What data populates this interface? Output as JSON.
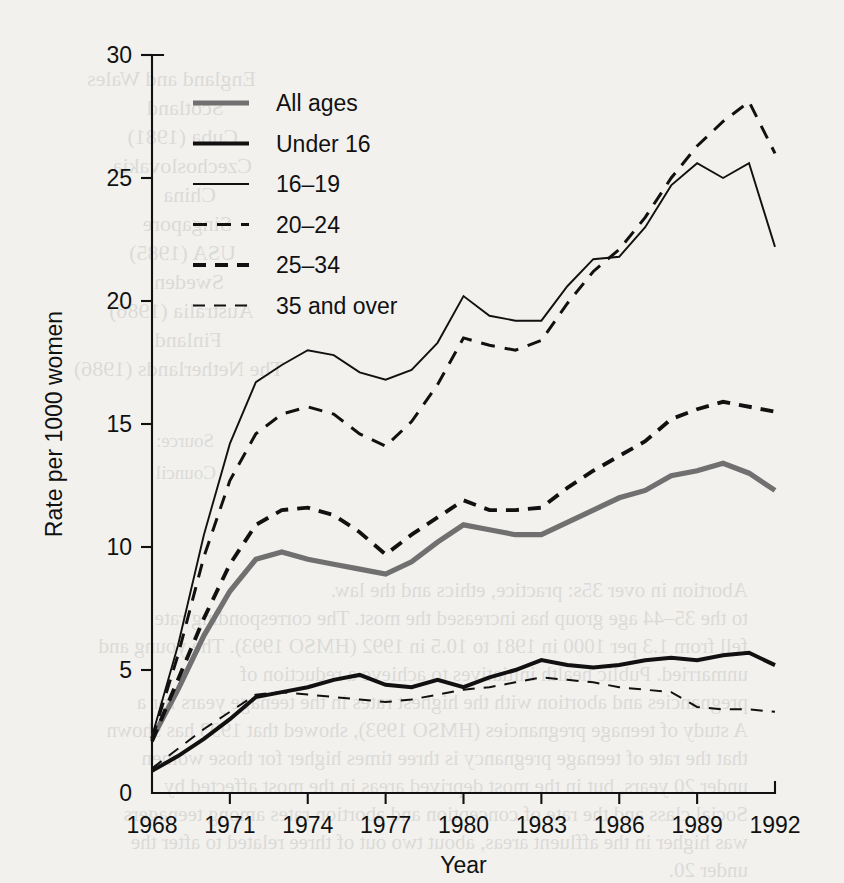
{
  "chart_data": {
    "type": "line",
    "title": "",
    "xlabel": "Year",
    "ylabel": "Rate per 1000 women",
    "xlim": [
      1968,
      1992
    ],
    "ylim": [
      0,
      30
    ],
    "grid": false,
    "legend_position": "top-left",
    "x_ticks": [
      "1968",
      "1971",
      "1974",
      "1977",
      "1980",
      "1983",
      "1986",
      "1989",
      "1992"
    ],
    "x_tick_values": [
      1968,
      1971,
      1974,
      1977,
      1980,
      1983,
      1986,
      1989,
      1992
    ],
    "y_ticks": [
      "0",
      "5",
      "10",
      "15",
      "20",
      "25",
      "30"
    ],
    "y_tick_values": [
      0,
      5,
      10,
      15,
      20,
      25,
      30
    ],
    "x": [
      1968,
      1969,
      1970,
      1971,
      1972,
      1973,
      1974,
      1975,
      1976,
      1977,
      1978,
      1979,
      1980,
      1981,
      1982,
      1983,
      1984,
      1985,
      1986,
      1987,
      1988,
      1989,
      1990,
      1991,
      1992
    ],
    "series": [
      {
        "name": "All ages",
        "style": "thick-grey-solid",
        "color": "#707070",
        "width": 5.2,
        "dash": "none",
        "values": [
          2.2,
          4.2,
          6.4,
          8.2,
          9.5,
          9.8,
          9.5,
          9.3,
          9.1,
          8.9,
          9.4,
          10.2,
          10.9,
          10.7,
          10.5,
          10.5,
          11.0,
          11.5,
          12.0,
          12.3,
          12.9,
          13.1,
          13.4,
          13.0,
          12.3
        ]
      },
      {
        "name": "Under 16",
        "style": "thick-black-solid",
        "color": "#111111",
        "width": 4.0,
        "dash": "none",
        "values": [
          0.9,
          1.5,
          2.2,
          3.0,
          3.9,
          4.1,
          4.3,
          4.6,
          4.8,
          4.4,
          4.3,
          4.6,
          4.3,
          4.7,
          5.0,
          5.4,
          5.2,
          5.1,
          5.2,
          5.4,
          5.5,
          5.4,
          5.6,
          5.7,
          5.2
        ]
      },
      {
        "name": "16–19",
        "style": "thin-black-solid",
        "color": "#111111",
        "width": 1.9,
        "dash": "none",
        "values": [
          2.3,
          6.0,
          10.5,
          14.2,
          16.7,
          17.4,
          18.0,
          17.8,
          17.1,
          16.8,
          17.2,
          18.3,
          20.2,
          19.4,
          19.2,
          19.2,
          20.6,
          21.7,
          21.8,
          23.0,
          24.7,
          25.6,
          25.0,
          25.6,
          22.2
        ]
      },
      {
        "name": "20–24",
        "style": "medium-dash",
        "color": "#111111",
        "width": 3.0,
        "dash": "14 10",
        "values": [
          2.2,
          5.6,
          9.6,
          12.7,
          14.6,
          15.4,
          15.7,
          15.4,
          14.6,
          14.1,
          15.1,
          16.6,
          18.5,
          18.2,
          18.0,
          18.4,
          19.9,
          21.2,
          22.1,
          23.4,
          25.0,
          26.3,
          27.3,
          28.1,
          26.0
        ]
      },
      {
        "name": "25–34",
        "style": "heavy-dash",
        "color": "#111111",
        "width": 3.9,
        "dash": "13 9",
        "values": [
          2.1,
          4.6,
          7.1,
          9.3,
          10.9,
          11.5,
          11.6,
          11.3,
          10.6,
          9.7,
          10.5,
          11.2,
          11.9,
          11.5,
          11.5,
          11.6,
          12.4,
          13.1,
          13.7,
          14.3,
          15.2,
          15.6,
          15.9,
          15.7,
          15.5
        ]
      },
      {
        "name": "35 and over",
        "style": "thin-dash",
        "color": "#111111",
        "width": 2.0,
        "dash": "12 9",
        "values": [
          1.0,
          1.8,
          2.6,
          3.3,
          4.0,
          4.1,
          4.0,
          3.9,
          3.8,
          3.7,
          3.8,
          4.0,
          4.2,
          4.3,
          4.5,
          4.7,
          4.6,
          4.5,
          4.3,
          4.2,
          4.1,
          3.5,
          3.4,
          3.4,
          3.3
        ]
      }
    ],
    "legend": [
      {
        "label": "All ages"
      },
      {
        "label": "Under 16"
      },
      {
        "label": "16–19"
      },
      {
        "label": "20–24"
      },
      {
        "label": "25–34"
      },
      {
        "label": "35 and over"
      }
    ]
  },
  "bleed_through": [
    {
      "text": "England and Wales",
      "x": 588,
      "y": 66,
      "size": 22
    },
    {
      "text": "Scotland",
      "x": 620,
      "y": 95,
      "size": 22
    },
    {
      "text": "Cuba (1981)",
      "x": 606,
      "y": 124,
      "size": 22
    },
    {
      "text": "Czechoslovakia",
      "x": 592,
      "y": 153,
      "size": 22
    },
    {
      "text": "China",
      "x": 628,
      "y": 182,
      "size": 22
    },
    {
      "text": "Singapore",
      "x": 612,
      "y": 211,
      "size": 22
    },
    {
      "text": "USA (1985)",
      "x": 608,
      "y": 240,
      "size": 22
    },
    {
      "text": "Sweden",
      "x": 620,
      "y": 269,
      "size": 22
    },
    {
      "text": "Australia (1986)",
      "x": 590,
      "y": 298,
      "size": 22
    },
    {
      "text": "Finland",
      "x": 622,
      "y": 327,
      "size": 22
    },
    {
      "text": "The Netherlands (1986)",
      "x": 560,
      "y": 356,
      "size": 22
    },
    {
      "text": "Source:",
      "x": 630,
      "y": 430,
      "size": 19
    },
    {
      "text": "Council",
      "x": 628,
      "y": 462,
      "size": 19
    },
    {
      "text": "Abortion in over 35s: practice, ethics and the law.",
      "x": 96,
      "y": 578,
      "size": 21
    },
    {
      "text": "to the 35–44 age group has increased the most. The corresponding rate",
      "x": 96,
      "y": 606,
      "size": 21
    },
    {
      "text": "fell from 1.3 per 1000 in 1981 to 10.5 in 1992 (HMSO 1993). The young and",
      "x": 96,
      "y": 634,
      "size": 21
    },
    {
      "text": "unmarried. Public health initiatives to achieve a reduction of",
      "x": 96,
      "y": 662,
      "size": 21
    },
    {
      "text": "pregnancies and abortion with the highest rates in the teenage years for a",
      "x": 96,
      "y": 690,
      "size": 21
    },
    {
      "text": "A study of teenage pregnancies (HMSO 1993), showed that 1993 has shown",
      "x": 96,
      "y": 718,
      "size": 21
    },
    {
      "text": "that the rate of teenage pregnancy is three times higher for those women",
      "x": 96,
      "y": 746,
      "size": 21
    },
    {
      "text": "under 20 years, but in the most deprived areas in the most affected by",
      "x": 96,
      "y": 774,
      "size": 21
    },
    {
      "text": "Social class and the rate of conception and abortion rates among teenagers",
      "x": 96,
      "y": 802,
      "size": 21
    },
    {
      "text": "was higher in the affluent areas, about two out of three related to after the",
      "x": 96,
      "y": 830,
      "size": 21
    },
    {
      "text": "under 20.",
      "x": 96,
      "y": 858,
      "size": 21
    }
  ]
}
